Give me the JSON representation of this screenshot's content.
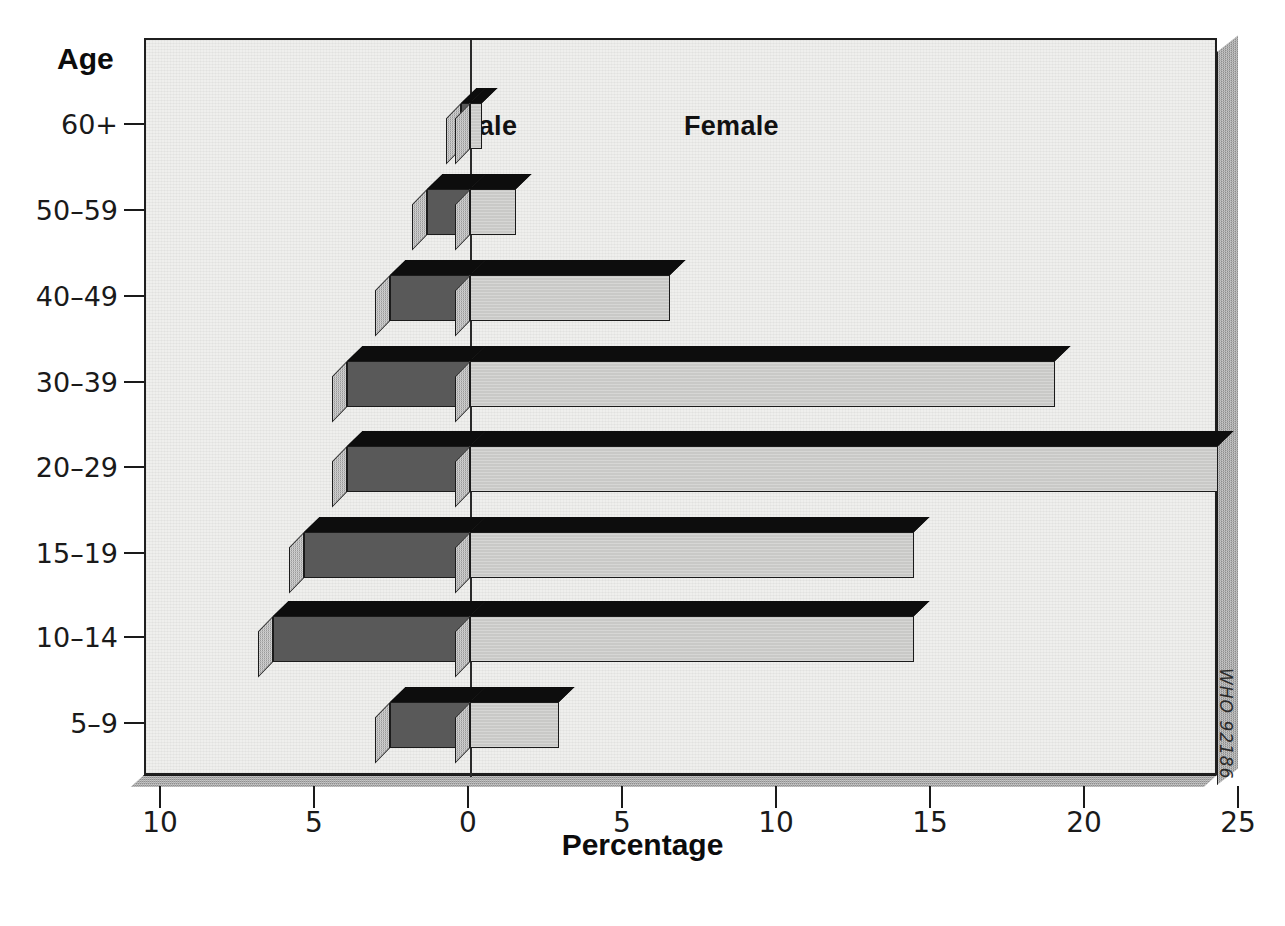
{
  "chart_data": {
    "type": "bar",
    "subtype": "population-pyramid",
    "title": "",
    "xlabel": "Percentage",
    "ylabel": "Age",
    "categories": [
      "60+",
      "50–59",
      "40–49",
      "30–39",
      "20–29",
      "15–19",
      "10–14",
      "5–9"
    ],
    "series": [
      {
        "name": "Male",
        "direction": "left",
        "values": [
          0.3,
          1.4,
          2.6,
          4.0,
          4.0,
          5.4,
          6.4,
          2.6
        ]
      },
      {
        "name": "Female",
        "direction": "right",
        "values": [
          0.4,
          1.5,
          6.5,
          19.0,
          24.3,
          14.4,
          14.4,
          2.9
        ]
      }
    ],
    "xlim_left": 10,
    "xlim_right": 25,
    "x_tick_values": [
      10,
      5,
      0,
      5,
      10,
      15,
      20,
      25
    ],
    "x_tick_labels": [
      "10",
      "5",
      "0",
      "5",
      "10",
      "15",
      "20",
      "25"
    ],
    "grid": false,
    "legend_position": "inside-top",
    "colors": {
      "male": "#595959",
      "female": "#c9c9c7",
      "bar_top": "#0d0d0d",
      "bar_side": "#9a9a9a",
      "plot_background": "#efefed",
      "frame": "#1f1f1f",
      "frame_shadow": "#8d8d8d"
    }
  },
  "axes": {
    "y_title": "Age",
    "x_title": "Percentage",
    "y_tick_labels": [
      "60+",
      "50–59",
      "40–49",
      "30–39",
      "20–29",
      "15–19",
      "10–14",
      "5–9"
    ],
    "x_tick_labels": [
      "10",
      "5",
      "0",
      "5",
      "10",
      "15",
      "20",
      "25"
    ]
  },
  "series_labels": {
    "male": "Male",
    "female": "Female"
  },
  "credit": {
    "text": "WHO 92186"
  }
}
